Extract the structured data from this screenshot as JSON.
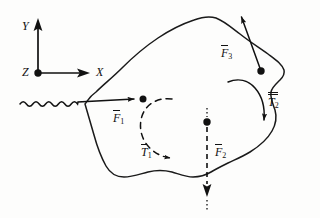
{
  "diagram": {
    "background_color": "#fdfdfc",
    "ink_color": "#111111",
    "axes": {
      "origin_label": "Z",
      "vertical_label": "Y",
      "horizontal_label": "X",
      "origin": [
        38,
        73
      ],
      "y_tip": [
        38,
        22
      ],
      "x_tip": [
        90,
        73
      ],
      "z_marker": "out-of-page-dot"
    },
    "body": {
      "name": "rigid-body-outline",
      "style": "irregular closed freehand blob"
    },
    "vectors": [
      {
        "id": "F1",
        "label": "F",
        "subscript": "1",
        "overbar": "single",
        "style": "wavy",
        "origin": [
          85,
          103
        ],
        "tip": [
          140,
          100
        ],
        "dot_at_tip": true,
        "label_pos": [
          113,
          114
        ],
        "direction": "right"
      },
      {
        "id": "F2",
        "label": "F",
        "subscript": "2",
        "overbar": "single",
        "style": "dashed",
        "origin": [
          207,
          118
        ],
        "tip": [
          207,
          205
        ],
        "dot_at_origin": true,
        "label_pos": [
          213,
          152
        ],
        "direction": "down"
      },
      {
        "id": "F3",
        "label": "F",
        "subscript": "3",
        "overbar": "single",
        "style": "solid",
        "origin": [
          261,
          71
        ],
        "tip": [
          239,
          9
        ],
        "dot_at_origin": true,
        "label_pos": [
          222,
          52
        ],
        "direction": "up"
      }
    ],
    "torques": [
      {
        "id": "T1",
        "label": "T",
        "subscript": "1",
        "overbar": "single",
        "style": "dashed-arc",
        "sense": "counterclockwise",
        "label_pos": [
          141,
          152
        ],
        "arrow_tip": [
          177,
          159
        ]
      },
      {
        "id": "T2",
        "label": "T",
        "subscript": "2",
        "overbar": "double",
        "style": "solid-arc",
        "sense": "clockwise",
        "label_pos": [
          268,
          100
        ],
        "arrow_tip": [
          264,
          129
        ]
      }
    ]
  }
}
